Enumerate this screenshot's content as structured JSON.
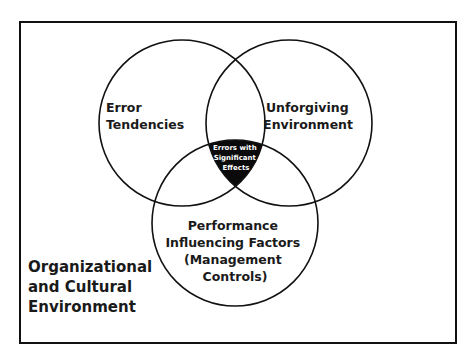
{
  "diagram": {
    "type": "venn",
    "frame": {
      "x": 20,
      "y": 22,
      "width": 436,
      "height": 321,
      "stroke": "#111111"
    },
    "circles": [
      {
        "id": "error-tendencies",
        "cx": 182,
        "cy": 123,
        "r": 83
      },
      {
        "id": "unforgiving-environment",
        "cx": 289,
        "cy": 123,
        "r": 83
      },
      {
        "id": "performance-influencing-factors",
        "cx": 235,
        "cy": 223,
        "r": 83
      }
    ],
    "intersection_fill": "#0a0a0a",
    "labels": {
      "error_tendencies": {
        "line1": "Error",
        "line2": "Tendencies"
      },
      "unforgiving_environment": {
        "line1": "Unforgiving",
        "line2": "Environment"
      },
      "center": {
        "line1": "Errors with",
        "line2": "Significant",
        "line3": "Effects"
      },
      "performance_factors": {
        "line1": "Performance",
        "line2": "Influencing Factors",
        "line3": "(Management",
        "line4": "Controls)"
      },
      "organizational": {
        "line1": "Organizational",
        "line2": "and Cultural",
        "line3": "Environment"
      }
    }
  }
}
